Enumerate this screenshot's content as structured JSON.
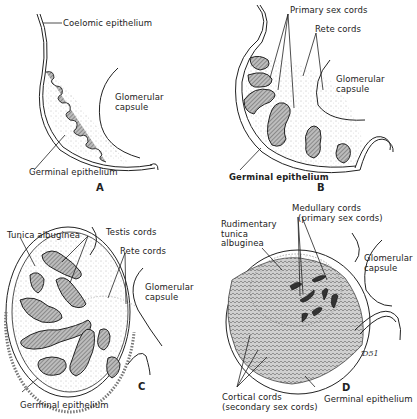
{
  "figure": {
    "panels": [
      {
        "id": "A",
        "letter": "A",
        "labels": {
          "coelomic_epithelium": "Coelomic epithelium",
          "glomerular_capsule_1": "Glomerular",
          "glomerular_capsule_2": "capsule",
          "germinal_epithelium": "Germinal epithelium"
        }
      },
      {
        "id": "B",
        "letter": "B",
        "labels": {
          "primary_sex_cords": "Primary sex cords",
          "rete_cords": "Rete cords",
          "glomerular_capsule_1": "Glomerular",
          "glomerular_capsule_2": "capsule",
          "germinal_epithelium": "Germinal epithelium"
        }
      },
      {
        "id": "C",
        "letter": "C",
        "labels": {
          "tunica_albuginea": "Tunica albuginea",
          "testis_cords": "Testis cords",
          "rete_cords": "Rete cords",
          "glomerular_capsule_1": "Glomerular",
          "glomerular_capsule_2": "capsule",
          "germinal_epithelium": "Germinal epithelium"
        }
      },
      {
        "id": "D",
        "letter": "D",
        "labels": {
          "medullary_cords_1": "Medullary cords",
          "medullary_cords_2": "(primary sex cords)",
          "rudimentary_1": "Rudimentary",
          "rudimentary_2": "tunica",
          "rudimentary_3": "albuginea",
          "glomerular_capsule_1": "Glomerular",
          "glomerular_capsule_2": "capsule",
          "cortical_cords_1": "Cortical cords",
          "cortical_cords_2": "(secondary sex cords)",
          "germinal_epithelium": "Germinal epithelium"
        }
      }
    ],
    "signature": "Ɗ51"
  },
  "colors": {
    "ink": "#222222",
    "stipple": "#9a9a9a",
    "hatch": "#8a8a8a",
    "background": "#ffffff"
  }
}
